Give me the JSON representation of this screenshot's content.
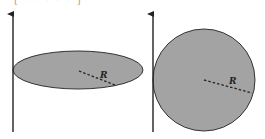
{
  "caption_fragment": "[ · · · · · ]",
  "colors": {
    "background": "#ffffff",
    "shape_fill": "#a3a3a3",
    "stroke": "#333333"
  },
  "panels": [
    {
      "id": "left",
      "shape": "ellipse",
      "axis_label": "",
      "radius_label": "R"
    },
    {
      "id": "right",
      "shape": "circle",
      "axis_label": "",
      "radius_label": "R"
    }
  ]
}
